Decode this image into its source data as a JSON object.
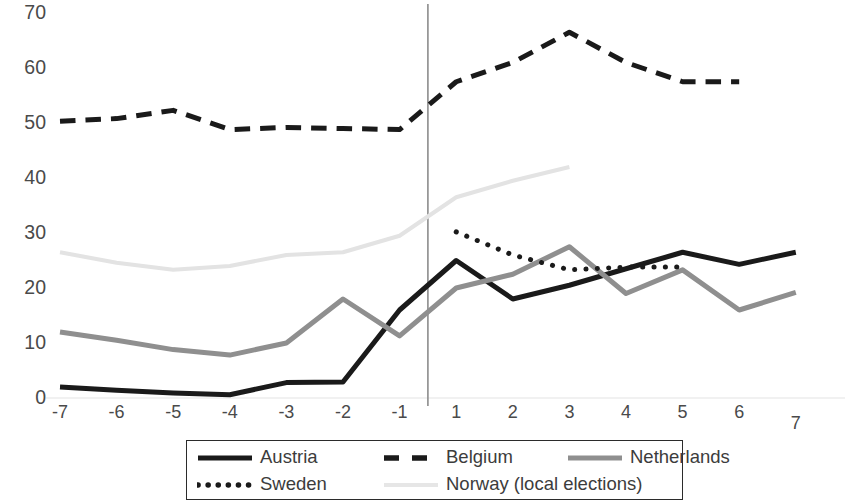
{
  "chart_data": {
    "type": "line",
    "title": "",
    "subtitle": "",
    "xlabel": "",
    "ylabel": "",
    "x": [
      -7,
      -6,
      -5,
      -4,
      -3,
      -2,
      -1,
      1,
      2,
      3,
      4,
      5,
      6,
      7
    ],
    "xticklabels": [
      "-7",
      "-6",
      "-5",
      "-4",
      "-3",
      "-2",
      "-1",
      "1",
      "2",
      "3",
      "4",
      "5",
      "6",
      "7"
    ],
    "yticklabels": [
      "0",
      "10",
      "20",
      "30",
      "40",
      "50",
      "60",
      "70"
    ],
    "ytickvalues": [
      0,
      10,
      20,
      30,
      40,
      50,
      60,
      70
    ],
    "xlim": [
      -7.6,
      7.6
    ],
    "ylim": [
      0,
      70
    ],
    "grid": false,
    "legend_position": "bottom",
    "annotations": [
      {
        "name": "reference-line",
        "type": "vline",
        "x": 0,
        "note": "vertical divider between pre (-7..-1) and post (1..7) periods"
      }
    ],
    "series": [
      {
        "name": "Austria",
        "style": "solid",
        "color": "#1a1a1a",
        "width": 5,
        "x": [
          -7,
          -6,
          -5,
          -4,
          -3,
          -2,
          -1,
          1,
          2,
          3,
          4,
          5,
          6,
          7
        ],
        "values": [
          2.0,
          1.4,
          0.9,
          0.6,
          2.8,
          2.9,
          16.0,
          25.0,
          18.0,
          20.5,
          23.5,
          26.5,
          24.3,
          26.5
        ]
      },
      {
        "name": "Belgium",
        "style": "dashed",
        "color": "#1a1a1a",
        "width": 5,
        "x": [
          -7,
          -6,
          -5,
          -4,
          -3,
          -2,
          -1,
          1,
          2,
          3,
          4,
          5,
          6
        ],
        "values": [
          50.3,
          50.8,
          52.3,
          48.8,
          49.2,
          49.0,
          48.8,
          57.5,
          61.0,
          66.5,
          61.0,
          57.5,
          57.5
        ]
      },
      {
        "name": "Netherlands",
        "style": "solid",
        "color": "#8f8f8f",
        "width": 5,
        "x": [
          -7,
          -6,
          -5,
          -4,
          -3,
          -2,
          -1,
          1,
          2,
          3,
          4,
          5,
          6,
          7
        ],
        "values": [
          12.0,
          10.5,
          8.8,
          7.8,
          10.0,
          18.0,
          11.3,
          20.0,
          22.5,
          27.5,
          19.0,
          23.3,
          16.0,
          19.2
        ]
      },
      {
        "name": "Sweden",
        "style": "dotted",
        "color": "#1a1a1a",
        "width": 5,
        "x": [
          1,
          2,
          3,
          4,
          5
        ],
        "values": [
          30.2,
          26.0,
          23.3,
          23.8,
          23.8
        ]
      },
      {
        "name": "Norway (local elections)",
        "style": "solid",
        "color": "#e3e3e3",
        "width": 4,
        "x": [
          -7,
          -6,
          -5,
          -4,
          -3,
          -2,
          -1,
          1,
          2,
          3
        ],
        "values": [
          26.5,
          24.6,
          23.3,
          24.0,
          26.0,
          26.5,
          29.5,
          36.5,
          39.5,
          42.0
        ]
      }
    ]
  },
  "legend": {
    "rows": [
      [
        {
          "label": "Austria",
          "swatch": "line-solid-black-swatch"
        },
        {
          "label": "Belgium",
          "swatch": "line-dashed-black-swatch"
        },
        {
          "label": "Netherlands",
          "swatch": "line-solid-gray-swatch"
        }
      ],
      [
        {
          "label": "Sweden",
          "swatch": "line-dotted-black-swatch"
        },
        {
          "label": "Norway (local elections)",
          "swatch": "line-solid-lightgray-swatch"
        }
      ]
    ]
  }
}
